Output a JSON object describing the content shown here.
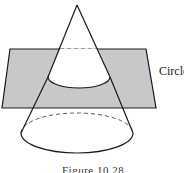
{
  "figure": {
    "label_circle": "Circle",
    "caption": "Figure 10.28",
    "colors": {
      "plane_fill": "#c8c8c8",
      "stroke": "#1a1a1a",
      "background": "#ffffff"
    },
    "shapes": {
      "plane": "parallelogram",
      "cone": "right circular cone",
      "cross_section": "circle (ellipse in perspective)"
    }
  }
}
